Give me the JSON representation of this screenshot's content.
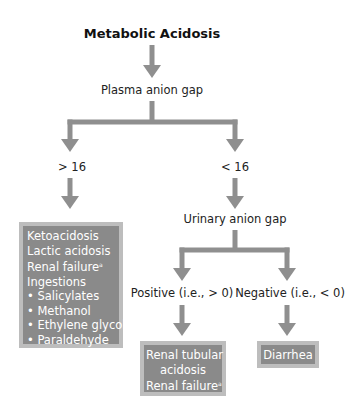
{
  "title": "Metabolic Acidosis",
  "colors": {
    "arrow": "#8f8f8f",
    "box_fill": "#8a8a8a",
    "box_border": "#bdbdbd",
    "box_text": "#ffffff"
  },
  "nodes": {
    "plasma_anion_gap": "Plasma anion gap",
    "gt16": "> 16",
    "lt16": "< 16",
    "urinary_anion_gap": "Urinary anion gap",
    "positive": "Positive (i.e., > 0)",
    "negative": "Negative (i.e., < 0)"
  },
  "high_gap_box": {
    "items": [
      {
        "text": "Ketoacidosis",
        "sup": ""
      },
      {
        "text": "Lactic acidosis",
        "sup": ""
      },
      {
        "text": "Renal failure",
        "sup": "a"
      },
      {
        "text": "Ingestions",
        "sup": ""
      },
      {
        "text": "• Salicylates",
        "sup": ""
      },
      {
        "text": "• Methanol",
        "sup": ""
      },
      {
        "text": "• Ethylene glycol",
        "sup": ""
      },
      {
        "text": "• Paraldehyde",
        "sup": ""
      }
    ]
  },
  "positive_box": {
    "items": [
      {
        "text": "Renal tubular",
        "sup": ""
      },
      {
        "text": "acidosis",
        "sup": ""
      },
      {
        "text": "Renal failure",
        "sup": "a"
      }
    ]
  },
  "negative_box": {
    "items": [
      {
        "text": "Diarrhea",
        "sup": ""
      }
    ]
  }
}
